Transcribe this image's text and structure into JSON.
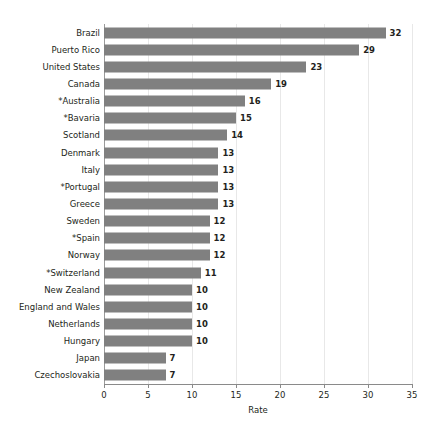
{
  "chart_data": {
    "type": "bar",
    "orientation": "horizontal",
    "title": "",
    "xlabel": "Rate",
    "ylabel": "",
    "xlim": [
      0,
      35
    ],
    "xticks": [
      0,
      5,
      10,
      15,
      20,
      25,
      30,
      35
    ],
    "xtick_labels": [
      "0",
      "5",
      "10",
      "15",
      "20",
      "25",
      "30",
      "35"
    ],
    "grid": "vertical",
    "legend": "none",
    "bar_color": "#808080",
    "gridline_color": "#e8e8e8",
    "axis_color": "#8a8a8a",
    "text_color": "#231f20",
    "categories": [
      "Brazil",
      "Puerto Rico",
      "United States",
      "Canada",
      "*Australia",
      "*Bavaria",
      "Scotland",
      "Denmark",
      "Italy",
      "*Portugal",
      "Greece",
      "Sweden",
      "*Spain",
      "Norway",
      "*Switzerland",
      "New Zealand",
      "England and Wales",
      "Netherlands",
      "Hungary",
      "Japan",
      "Czechoslovakia"
    ],
    "values": [
      32,
      29,
      23,
      19,
      16,
      15,
      14,
      13,
      13,
      13,
      13,
      12,
      12,
      12,
      11,
      10,
      10,
      10,
      10,
      7,
      7
    ],
    "value_labels": [
      "32",
      "29",
      "23",
      "19",
      "16",
      "15",
      "14",
      "13",
      "13",
      "13",
      "13",
      "12",
      "12",
      "12",
      "11",
      "10",
      "10",
      "10",
      "10",
      "7",
      "7"
    ]
  }
}
